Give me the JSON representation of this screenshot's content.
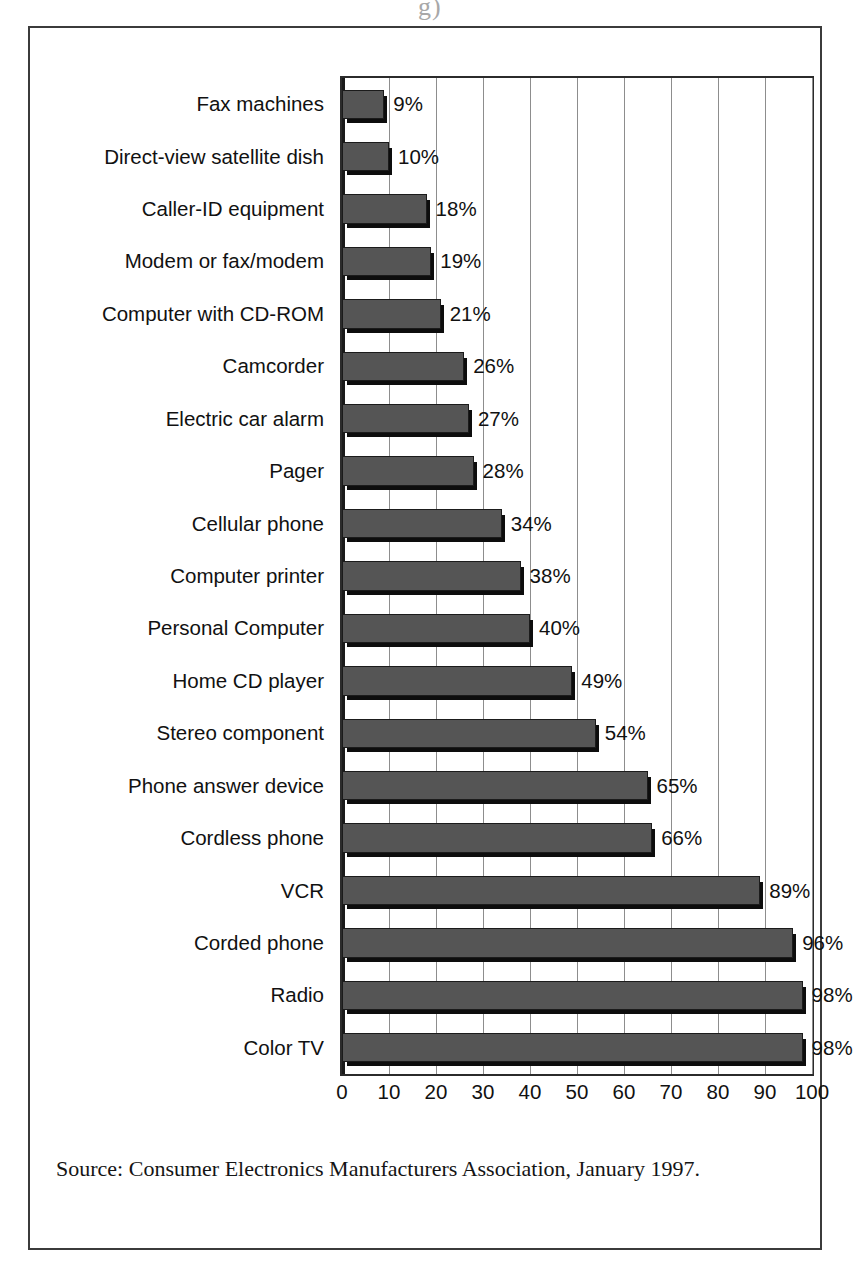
{
  "figure": {
    "scan_artifact": "g)",
    "source_note": "Source: Consumer Electronics Manufacturers Association, January 1997."
  },
  "chart_data": {
    "type": "bar",
    "orientation": "horizontal",
    "title": "",
    "subtitle": "",
    "xlabel": "",
    "ylabel": "",
    "xlim": [
      0,
      100
    ],
    "xticks": [
      "0",
      "10",
      "20",
      "30",
      "40",
      "50",
      "60",
      "70",
      "80",
      "90",
      "100"
    ],
    "xtick_values": [
      0,
      10,
      20,
      30,
      40,
      50,
      60,
      70,
      80,
      90,
      100
    ],
    "grid": true,
    "grid_axis": "x",
    "legend": "none",
    "value_label_suffix": "%",
    "bar_color": "#555555",
    "bar_edge_color": "#1b1b1b",
    "categories": [
      "Fax machines",
      "Direct-view satellite dish",
      "Caller-ID equipment",
      "Modem or fax/modem",
      "Computer with CD-ROM",
      "Camcorder",
      "Electric car alarm",
      "Pager",
      "Cellular phone",
      "Computer printer",
      "Personal Computer",
      "Home CD player",
      "Stereo component",
      "Phone answer device",
      "Cordless phone",
      "VCR",
      "Corded phone",
      "Radio",
      "Color TV"
    ],
    "values": [
      9,
      10,
      18,
      19,
      21,
      26,
      27,
      28,
      34,
      38,
      40,
      49,
      54,
      65,
      66,
      89,
      96,
      98,
      98
    ],
    "value_labels": [
      "9%",
      "10%",
      "18%",
      "19%",
      "21%",
      "26%",
      "27%",
      "28%",
      "34%",
      "38%",
      "40%",
      "49%",
      "54%",
      "65%",
      "66%",
      "89%",
      "96%",
      "98%",
      "98%"
    ]
  }
}
